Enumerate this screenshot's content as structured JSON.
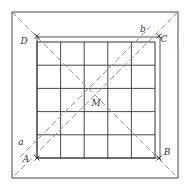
{
  "diagram": {
    "type": "geometry-figure",
    "colors": {
      "solid": "#555555",
      "grid": "#333333",
      "dashed": "#9a9a9a",
      "text": "#333333"
    },
    "outer_square": {
      "x1": 12,
      "y1": 12,
      "x2": 178,
      "y2": 178
    },
    "square_ABCD": {
      "x1": 37,
      "y1": 37,
      "x2": 160,
      "y2": 158
    },
    "grid": {
      "x1": 37,
      "y1": 42,
      "x2": 155,
      "y2": 158,
      "cols": 5,
      "rows": 5
    },
    "points": [
      {
        "name": "A",
        "label": "A",
        "x": 37,
        "y": 158,
        "lx": 26,
        "ly": 162
      },
      {
        "name": "B",
        "label": "B",
        "x": 159,
        "y": 158,
        "lx": 167,
        "ly": 155
      },
      {
        "name": "C",
        "label": "C",
        "x": 159,
        "y": 36,
        "lx": 164,
        "ly": 42
      },
      {
        "name": "D",
        "label": "D",
        "x": 37,
        "y": 36,
        "lx": 24,
        "ly": 44
      },
      {
        "name": "M",
        "label": "M",
        "x": 96,
        "y": 96,
        "lx": 96,
        "ly": 106
      },
      {
        "name": "a",
        "label": "a",
        "x": 37,
        "y": 140,
        "lx": 21,
        "ly": 145
      },
      {
        "name": "b",
        "label": "b",
        "x": 143,
        "y": 33,
        "lx": 143,
        "ly": 32
      }
    ],
    "dashed_lines": [
      {
        "name": "diagonal-main",
        "x1": 12,
        "y1": 12,
        "x2": 178,
        "y2": 178
      },
      {
        "name": "diagonal-anti",
        "x1": 178,
        "y1": 12,
        "x2": 12,
        "y2": 178
      },
      {
        "name": "line-ab",
        "x1": 20,
        "y1": 157,
        "x2": 150,
        "y2": 27
      }
    ]
  }
}
